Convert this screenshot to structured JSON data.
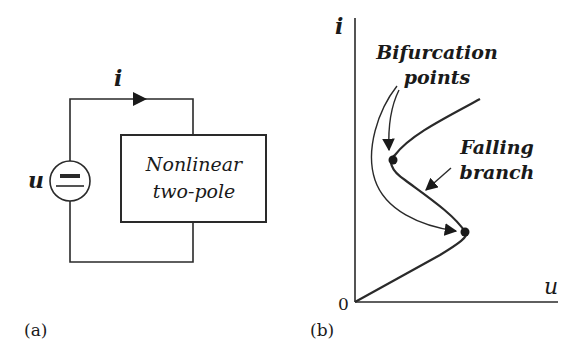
{
  "panel_a": {
    "caption": "(a)",
    "current_label": "i",
    "voltage_label": "u",
    "box_line1": "Nonlinear",
    "box_line2": "two-pole"
  },
  "panel_b": {
    "caption": "(b)",
    "y_axis_label": "i",
    "x_axis_label": "u",
    "origin_label": "0",
    "annotation_bifurcation_line1": "Bifurcation",
    "annotation_bifurcation_line2": "points",
    "annotation_falling_line1": "Falling",
    "annotation_falling_line2": "branch"
  },
  "colors": {
    "stroke": "#2a2a2a",
    "text": "#1a1a1a"
  }
}
